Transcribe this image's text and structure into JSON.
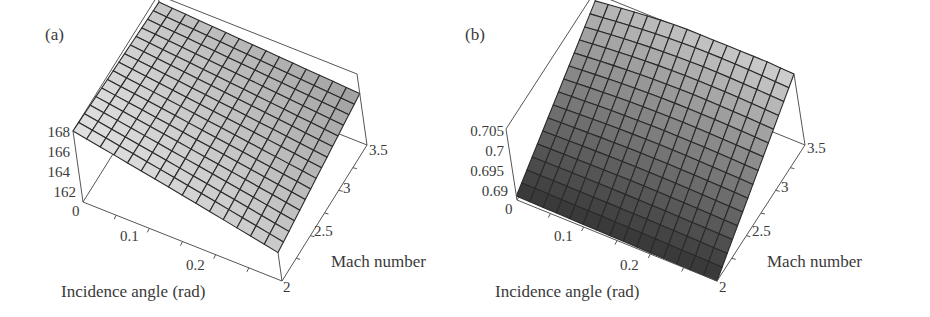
{
  "chart_data": [
    {
      "type": "surface3d",
      "panel_label": "(a)",
      "xlabel": "Incidence angle (rad)",
      "ylabel": "Mach number",
      "zlabel": "",
      "x_ticks": [
        "0",
        "0.1",
        "0.2"
      ],
      "y_ticks": [
        "2",
        "2.5",
        "3",
        "3.5"
      ],
      "z_ticks": [
        "162",
        "164",
        "166",
        "168"
      ],
      "xlim": [
        0,
        0.3
      ],
      "ylim": [
        2,
        3.5
      ],
      "zlim": [
        160,
        168
      ],
      "grid_size": 15,
      "surface_description": "Nearly planar surface, highest (~168) at incidence 0 and Mach 2, decreasing gently with Mach number and incidence; light grey shading",
      "corner_values": {
        "x0_y2": 168.0,
        "x0_y3.5": 167.2,
        "x0.3_y2": 163.5,
        "x0.3_y3.5": 165.8
      },
      "shade": "light"
    },
    {
      "type": "surface3d",
      "panel_label": "(b)",
      "xlabel": "Incidence angle (rad)",
      "ylabel": "Mach number",
      "zlabel": "",
      "x_ticks": [
        "0",
        "0.1",
        "0.2"
      ],
      "y_ticks": [
        "2",
        "2.5",
        "3",
        "3.5"
      ],
      "z_ticks": [
        "0.69",
        "0.695",
        "0.7",
        "0.705"
      ],
      "xlim": [
        0,
        0.3
      ],
      "ylim": [
        2,
        3.5
      ],
      "zlim": [
        0.687,
        0.705
      ],
      "grid_size": 15,
      "surface_description": "Surface rising with Mach number from ~0.688 at Mach 2 to ~0.705 at Mach 3.5, nearly flat in incidence angle; dark grey shading",
      "corner_values": {
        "x0_y2": 0.688,
        "x0_y3.5": 0.703,
        "x0.3_y2": 0.687,
        "x0.3_y3.5": 0.705
      },
      "shade": "dark"
    }
  ],
  "panels": {
    "a": {
      "label": "(a)",
      "xlabel": "Incidence angle (rad)",
      "ylabel": "Mach number",
      "z_ticks": [
        "168",
        "166",
        "164",
        "162",
        "0"
      ],
      "x_ticks": [
        "0.1",
        "0.2"
      ],
      "y_ticks": [
        "3.5",
        "3",
        "2.5",
        "2"
      ]
    },
    "b": {
      "label": "(b)",
      "xlabel": "Incidence angle (rad)",
      "ylabel": "Mach number",
      "z_ticks": [
        "0.705",
        "0.7",
        "0.695",
        "0.69",
        "0"
      ],
      "x_ticks": [
        "0.1",
        "0.2"
      ],
      "y_ticks": [
        "3.5",
        "3",
        "2.5",
        "2"
      ]
    }
  },
  "colors": {
    "box_line": "#555555",
    "grid_line": "#2a2a2a",
    "text": "#3a3a3a",
    "surface_a_light": "#f2f2f2",
    "surface_a_dark": "#7a7a7a",
    "surface_b_light": "#d8d8d8",
    "surface_b_dark": "#1e1e1e"
  }
}
